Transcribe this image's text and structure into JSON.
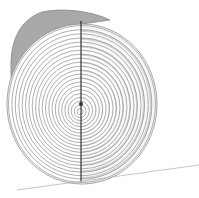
{
  "diagram": {
    "colors": {
      "background": "#ffffff",
      "bark": "#a9a9a9",
      "bark_edge": "#8a8a8a",
      "ring_line": "#8c8c8c",
      "ring_fill": "#d2d2d2",
      "split_line": "#222222",
      "ground_line": "#b8b8b8"
    },
    "face": {
      "cx": 82,
      "cy": 104,
      "rx": 75,
      "ry": 80
    },
    "rings": 22,
    "split_line": {
      "x": 81,
      "y1": 21,
      "y2": 182
    },
    "ground_line": {
      "x1": 17,
      "y1": 190,
      "x2": 199,
      "y2": 165
    }
  }
}
